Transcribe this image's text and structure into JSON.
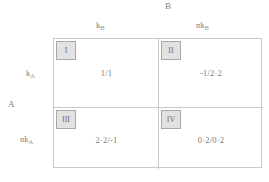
{
  "diagram": {
    "type": "payoff-matrix",
    "row_player": "A",
    "column_player": "B",
    "column_headers": [
      {
        "base": "k",
        "sub": "B"
      },
      {
        "base": "nk",
        "sub": "B"
      }
    ],
    "row_headers": [
      {
        "base": "k",
        "sub": "A"
      },
      {
        "base": "nk",
        "sub": "A"
      }
    ],
    "cells": [
      {
        "tag": "I",
        "payoff": "1/1"
      },
      {
        "tag": "II",
        "payoff": "-1/2·2"
      },
      {
        "tag": "III",
        "payoff": "2·2/-1"
      },
      {
        "tag": "IV",
        "payoff": "0·2/0·2"
      }
    ],
    "colors": {
      "line": "#c9c9c9",
      "tag_fill": "#e2e2e2",
      "tag_border": "#a8a8a8",
      "text": "#7a7a7a",
      "background": "#ffffff"
    }
  }
}
